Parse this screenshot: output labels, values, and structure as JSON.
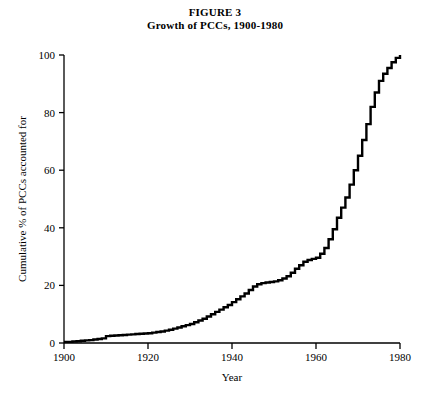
{
  "figure": {
    "title": "FIGURE 3",
    "subtitle": "Growth of PCCs, 1900-1980"
  },
  "chart_data": {
    "type": "line",
    "title": "Growth of PCCs, 1900-1980",
    "subtitle": "FIGURE 3",
    "xlabel": "Year",
    "ylabel": "Cumulative % of PCCs accounted for",
    "xlim": [
      1900,
      1980
    ],
    "ylim": [
      0,
      100
    ],
    "xticks": [
      1900,
      1920,
      1940,
      1960,
      1980
    ],
    "yticks": [
      0,
      20,
      40,
      60,
      80,
      100
    ],
    "grid": false,
    "legend": false,
    "line_style": "step",
    "line_color": "#000000",
    "line_width": 2.4,
    "x": [
      1900,
      1901,
      1902,
      1903,
      1904,
      1905,
      1906,
      1907,
      1908,
      1909,
      1910,
      1911,
      1912,
      1913,
      1914,
      1915,
      1916,
      1917,
      1918,
      1919,
      1920,
      1921,
      1922,
      1923,
      1924,
      1925,
      1926,
      1927,
      1928,
      1929,
      1930,
      1931,
      1932,
      1933,
      1934,
      1935,
      1936,
      1937,
      1938,
      1939,
      1940,
      1941,
      1942,
      1943,
      1944,
      1945,
      1946,
      1947,
      1948,
      1949,
      1950,
      1951,
      1952,
      1953,
      1954,
      1955,
      1956,
      1957,
      1958,
      1959,
      1960,
      1961,
      1962,
      1963,
      1964,
      1965,
      1966,
      1967,
      1968,
      1969,
      1970,
      1971,
      1972,
      1973,
      1974,
      1975,
      1976,
      1977,
      1978,
      1979,
      1980
    ],
    "values": [
      0.4,
      0.4,
      0.5,
      0.6,
      0.8,
      0.9,
      1.0,
      1.2,
      1.4,
      1.6,
      2.4,
      2.5,
      2.6,
      2.7,
      2.8,
      2.9,
      3.0,
      3.1,
      3.2,
      3.3,
      3.4,
      3.6,
      3.8,
      4.0,
      4.3,
      4.6,
      5.0,
      5.4,
      5.8,
      6.2,
      6.6,
      7.2,
      7.8,
      8.4,
      9.2,
      10.0,
      10.8,
      11.6,
      12.4,
      13.2,
      14.2,
      15.2,
      16.2,
      17.2,
      18.4,
      19.6,
      20.4,
      20.8,
      21.0,
      21.2,
      21.4,
      21.8,
      22.4,
      23.2,
      24.4,
      25.8,
      27.0,
      28.2,
      28.8,
      29.2,
      29.6,
      31.0,
      33.0,
      36.0,
      39.5,
      43.5,
      47.0,
      50.5,
      55.0,
      60.0,
      65.0,
      70.5,
      76.0,
      82.0,
      87.0,
      91.0,
      93.5,
      95.5,
      97.5,
      99.0,
      100.0
    ]
  },
  "axis": {
    "x_tick_labels": [
      "1900",
      "1920",
      "1940",
      "1960",
      "1980"
    ],
    "y_tick_labels": [
      "0",
      "20",
      "40",
      "60",
      "80",
      "100"
    ],
    "x_title": "Year",
    "y_title": "Cumulative % of PCCs accounted for"
  },
  "colors": {
    "background": "#ffffff",
    "axis": "#000000",
    "series": "#000000"
  }
}
